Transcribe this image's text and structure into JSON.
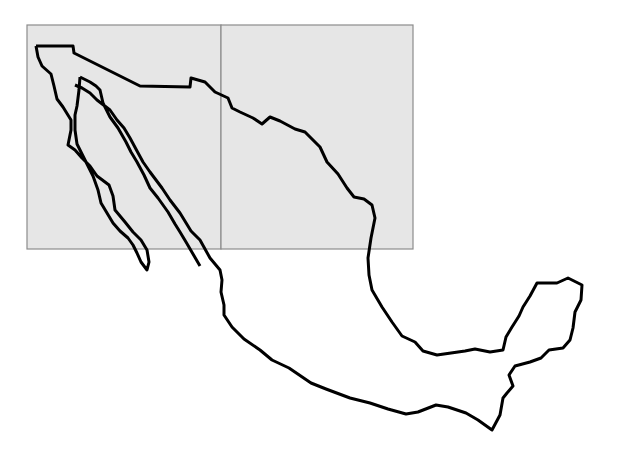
{
  "map": {
    "subject": "Mexico outline",
    "regions": [
      {
        "name": "left-box",
        "x": 27,
        "y": 25,
        "w": 194,
        "h": 224
      },
      {
        "name": "right-box",
        "x": 221,
        "y": 25,
        "w": 192,
        "h": 224
      }
    ],
    "colors": {
      "box_fill": "#e6e6e6",
      "box_stroke": "#8c8c8c",
      "outline": "#000000",
      "background": "#ffffff"
    }
  }
}
